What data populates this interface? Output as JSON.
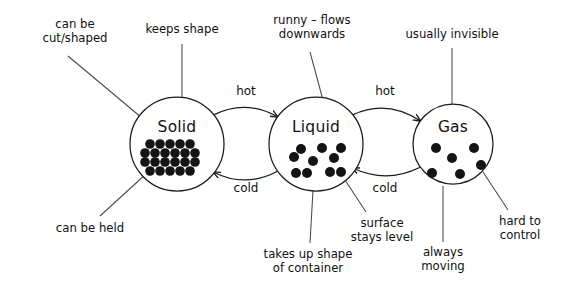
{
  "diagram": {
    "background_color": "#ffffff",
    "ink_color": "#141414",
    "leader_color": "#4a4a4a"
  },
  "states": [
    {
      "id": "solid",
      "label": "Solid",
      "cx": 177,
      "cy": 144,
      "r": 47,
      "particle_arrangement": "regular close-packed grid",
      "particle_count": 22,
      "particles": [
        {
          "x": 150,
          "y": 144
        },
        {
          "x": 160,
          "y": 144
        },
        {
          "x": 170,
          "y": 144
        },
        {
          "x": 180,
          "y": 144
        },
        {
          "x": 190,
          "y": 144
        },
        {
          "x": 145,
          "y": 153
        },
        {
          "x": 155,
          "y": 153
        },
        {
          "x": 165,
          "y": 153
        },
        {
          "x": 175,
          "y": 153
        },
        {
          "x": 185,
          "y": 153
        },
        {
          "x": 195,
          "y": 153
        },
        {
          "x": 145,
          "y": 162
        },
        {
          "x": 155,
          "y": 162
        },
        {
          "x": 165,
          "y": 162
        },
        {
          "x": 175,
          "y": 162
        },
        {
          "x": 185,
          "y": 162
        },
        {
          "x": 195,
          "y": 162
        },
        {
          "x": 150,
          "y": 171
        },
        {
          "x": 160,
          "y": 171
        },
        {
          "x": 170,
          "y": 171
        },
        {
          "x": 180,
          "y": 171
        },
        {
          "x": 190,
          "y": 171
        }
      ],
      "particle_radius": 4.8
    },
    {
      "id": "liquid",
      "label": "Liquid",
      "cx": 316,
      "cy": 144,
      "r": 47,
      "particle_arrangement": "loose irregular cluster",
      "particle_count": 9,
      "particles": [
        {
          "x": 301,
          "y": 149
        },
        {
          "x": 322,
          "y": 148
        },
        {
          "x": 341,
          "y": 148
        },
        {
          "x": 294,
          "y": 157
        },
        {
          "x": 313,
          "y": 161
        },
        {
          "x": 334,
          "y": 158
        },
        {
          "x": 296,
          "y": 173
        },
        {
          "x": 307,
          "y": 173
        },
        {
          "x": 330,
          "y": 172
        },
        {
          "x": 341,
          "y": 172
        }
      ],
      "particle_radius": 5.0
    },
    {
      "id": "gas",
      "label": "Gas",
      "cx": 453,
      "cy": 144,
      "r": 40,
      "particle_arrangement": "widely spaced scattered",
      "particle_count": 6,
      "particles": [
        {
          "x": 436,
          "y": 148
        },
        {
          "x": 474,
          "y": 148
        },
        {
          "x": 452,
          "y": 158
        },
        {
          "x": 481,
          "y": 165
        },
        {
          "x": 432,
          "y": 173
        },
        {
          "x": 460,
          "y": 174
        }
      ],
      "particle_radius": 5.0
    }
  ],
  "transitions": [
    {
      "id": "solid-to-liquid",
      "label": "hot",
      "from": "solid",
      "to": "liquid",
      "direction": "right",
      "label_x": 246,
      "label_y": 95
    },
    {
      "id": "liquid-to-solid",
      "label": "cold",
      "from": "liquid",
      "to": "solid",
      "direction": "left",
      "label_x": 246,
      "label_y": 192
    },
    {
      "id": "liquid-to-gas",
      "label": "hot",
      "from": "liquid",
      "to": "gas",
      "direction": "right",
      "label_x": 385,
      "label_y": 95
    },
    {
      "id": "gas-to-liquid",
      "label": "cold",
      "from": "gas",
      "to": "liquid",
      "direction": "left",
      "label_x": 385,
      "label_y": 192
    }
  ],
  "annotations": [
    {
      "id": "can-be-cut-shaped",
      "state": "solid",
      "lines": [
        "can be",
        "cut/shaped"
      ],
      "text_x": 75,
      "text_y": 28,
      "leader": {
        "x1": 68,
        "y1": 56,
        "x2": 142,
        "y2": 118
      }
    },
    {
      "id": "keeps-shape",
      "state": "solid",
      "lines": [
        "keeps shape"
      ],
      "text_x": 182,
      "text_y": 33,
      "leader": {
        "x1": 182,
        "y1": 44,
        "x2": 182,
        "y2": 98
      }
    },
    {
      "id": "can-be-held",
      "state": "solid",
      "lines": [
        "can be held"
      ],
      "text_x": 90,
      "text_y": 232,
      "leader": {
        "x1": 100,
        "y1": 216,
        "x2": 146,
        "y2": 174
      }
    },
    {
      "id": "runny-flows-downwards",
      "state": "liquid",
      "lines": [
        "runny – flows",
        "downwards"
      ],
      "text_x": 312,
      "text_y": 24,
      "leader": {
        "x1": 310,
        "y1": 52,
        "x2": 323,
        "y2": 100
      }
    },
    {
      "id": "takes-up-shape-of-container",
      "state": "liquid",
      "lines": [
        "takes up shape",
        "of container"
      ],
      "text_x": 308,
      "text_y": 258,
      "leader": {
        "x1": 310,
        "y1": 243,
        "x2": 313,
        "y2": 190
      }
    },
    {
      "id": "surface-stays-level",
      "state": "liquid",
      "lines": [
        "surface",
        "stays level"
      ],
      "text_x": 382,
      "text_y": 227,
      "leader": {
        "x1": 366,
        "y1": 212,
        "x2": 345,
        "y2": 180
      }
    },
    {
      "id": "usually-invisible",
      "state": "gas",
      "lines": [
        "usually invisible"
      ],
      "text_x": 452,
      "text_y": 38,
      "leader": {
        "x1": 452,
        "y1": 48,
        "x2": 452,
        "y2": 104
      }
    },
    {
      "id": "always-moving",
      "state": "gas",
      "lines": [
        "always",
        "moving"
      ],
      "text_x": 443,
      "text_y": 256,
      "leader": {
        "x1": 443,
        "y1": 242,
        "x2": 443,
        "y2": 186
      }
    },
    {
      "id": "hard-to-control",
      "state": "gas",
      "lines": [
        "hard to",
        "control"
      ],
      "text_x": 520,
      "text_y": 225,
      "leader": {
        "x1": 508,
        "y1": 210,
        "x2": 483,
        "y2": 172
      }
    }
  ]
}
